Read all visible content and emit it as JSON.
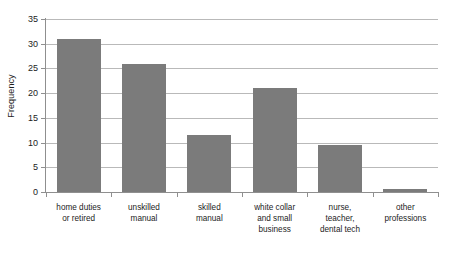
{
  "chart_data": {
    "type": "bar",
    "title": "",
    "xlabel": "",
    "ylabel": "Frequency",
    "ylim": [
      0,
      35
    ],
    "ytick_labels": [
      "0",
      "5",
      "10",
      "15",
      "20",
      "25",
      "30",
      "35"
    ],
    "ytick_values": [
      0,
      5,
      10,
      15,
      20,
      25,
      30,
      35
    ],
    "grid": true,
    "legend": "none",
    "bar_color": "#7b7b7b",
    "axis_color": "#8f8f8f",
    "gridline_color": "#b9b9b9",
    "text_color": "#1c1c1c",
    "categories": [
      "home duties or retired",
      "unskilled manual",
      "skilled manual",
      "white collar and small business",
      "nurse, teacher, dental tech",
      "other professions"
    ],
    "category_label_lines": [
      [
        "home duties",
        "or retired"
      ],
      [
        "unskilled",
        "manual"
      ],
      [
        "skilled",
        "manual"
      ],
      [
        "white collar",
        "and small",
        "business"
      ],
      [
        "nurse,",
        "teacher,",
        "dental tech"
      ],
      [
        "other",
        "professions"
      ]
    ],
    "values": [
      31,
      26,
      11.5,
      21,
      9.5,
      0.7
    ]
  }
}
